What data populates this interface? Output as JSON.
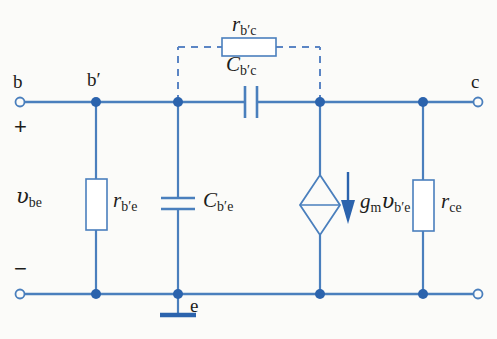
{
  "figure": {
    "type": "circuit-schematic",
    "background_color": "#fbfbf9",
    "wire_color": "#4a7fbd",
    "dashed_color": "#5b85c4",
    "node_color": "#2b63ad",
    "label_color": "#1d1d1b"
  },
  "terminals": [
    {
      "id": "b",
      "label": "b",
      "x": 20,
      "y": 102,
      "style": "open-circle"
    },
    {
      "id": "c",
      "label": "c",
      "x": 478,
      "y": 102,
      "style": "open-circle"
    },
    {
      "id": "b_bottom",
      "label": "",
      "x": 20,
      "y": 294,
      "style": "open-circle"
    },
    {
      "id": "c_bottom",
      "label": "",
      "x": 478,
      "y": 294,
      "style": "open-circle"
    }
  ],
  "nodes": [
    {
      "id": "bprime",
      "label": "b′",
      "x": 96,
      "y": 102
    },
    {
      "id": "internal_top",
      "label": "",
      "x": 178,
      "y": 102
    },
    {
      "id": "collector_node",
      "label": "",
      "x": 320,
      "y": 102
    },
    {
      "id": "rce_top",
      "label": "",
      "x": 423,
      "y": 102
    },
    {
      "id": "bprime_bottom",
      "label": "",
      "x": 96,
      "y": 294
    },
    {
      "id": "e",
      "label": "e",
      "x": 178,
      "y": 294
    },
    {
      "id": "src_bottom",
      "label": "",
      "x": 320,
      "y": 294
    },
    {
      "id": "rce_bottom",
      "label": "",
      "x": 423,
      "y": 294
    }
  ],
  "components": [
    {
      "id": "rbc",
      "kind": "resistor",
      "orientation": "horizontal",
      "label_main": "r",
      "label_sub": "b′c",
      "label_x": 232,
      "label_y": 16,
      "dashed": true
    },
    {
      "id": "cbc",
      "kind": "capacitor",
      "orientation": "vertical-plates",
      "label_main": "C",
      "label_sub": "b′c",
      "label_x": 226,
      "label_y": 56
    },
    {
      "id": "rbe",
      "kind": "resistor",
      "orientation": "vertical",
      "label_main": "r",
      "label_sub": "b′e",
      "label_x": 112,
      "label_y": 190
    },
    {
      "id": "cbe",
      "kind": "capacitor",
      "orientation": "horizontal-plates",
      "label_main": "C",
      "label_sub": "b′e",
      "label_x": 196,
      "label_y": 190
    },
    {
      "id": "current_source",
      "kind": "dependent-current-source",
      "shape": "diamond",
      "label_main": "g",
      "label_sub1": "m",
      "label_var": "υ",
      "label_sub2": "b′e",
      "label_x": 360,
      "label_y": 190,
      "arrow_direction": "down"
    },
    {
      "id": "rce",
      "kind": "resistor",
      "orientation": "vertical",
      "label_main": "r",
      "label_sub": "ce",
      "label_x": 440,
      "label_y": 190
    }
  ],
  "annotations": [
    {
      "id": "vbe",
      "text_var": "υ",
      "text_sub": "be",
      "x": 16,
      "y": 186
    },
    {
      "id": "plus_sign",
      "text": "+",
      "x": 14,
      "y": 118
    },
    {
      "id": "minus_sign",
      "text": "−",
      "x": 14,
      "y": 260
    },
    {
      "id": "ground",
      "text": "",
      "x": 178,
      "y": 294,
      "style": "earth-ground"
    }
  ]
}
